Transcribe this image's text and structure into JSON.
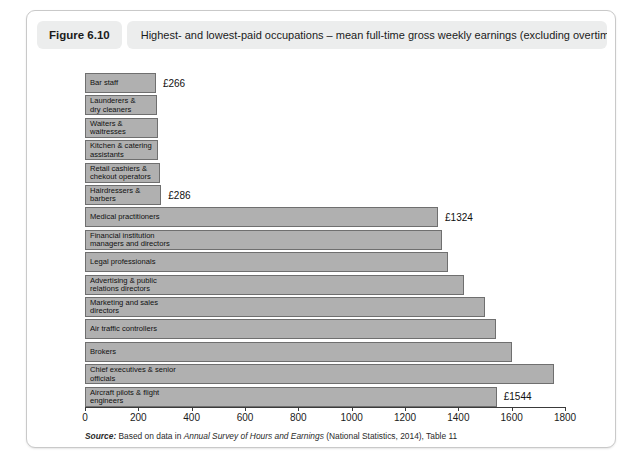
{
  "figure": {
    "number": "Figure 6.10",
    "title": "Highest- and lowest-paid occupations – mean full-time gross weekly earnings (excluding overtime) (£): 2014"
  },
  "source": {
    "prefix": "Source:",
    "lead": "Based on data in",
    "publication": "Annual Survey of Hours and Earnings",
    "suffix": "(National Statistics, 2014), Table 11"
  },
  "chart_data": {
    "type": "bar",
    "orientation": "horizontal",
    "title": "Highest- and lowest-paid occupations – mean full-time gross weekly earnings (excluding overtime) (£): 2014",
    "xlabel": "",
    "ylabel": "",
    "xlim": [
      0,
      1800
    ],
    "xticks": [
      0,
      200,
      400,
      600,
      800,
      1000,
      1200,
      1400,
      1600,
      1800
    ],
    "xticklabels": [
      "0",
      "200",
      "400",
      "600",
      "800",
      "1000",
      "1200",
      "1400",
      "1600",
      "1800"
    ],
    "grid": false,
    "legend": false,
    "bar_color": "#b0b0b0",
    "bar_border_color": "#6f6f6f",
    "categories": [
      "Bar staff",
      "Launderers &\ndry cleaners",
      "Waiters &\nwaitresses",
      "Kitchen & catering\nassistants",
      "Retail cashiers &\nchekout operators",
      "Hairdressers &\nbarbers",
      "Medical practitioners",
      "Financial institution\nmanagers and directors",
      "Legal professionals",
      "Advertising & public\nrelations directors",
      "Marketing and sales\ndirectors",
      "Air traffic controllers",
      "Brokers",
      "Chief executives & senior\nofficials",
      "Aircraft pilots & flight\nengineers"
    ],
    "values": [
      266,
      270,
      272,
      274,
      280,
      286,
      1324,
      1340,
      1360,
      1420,
      1500,
      1540,
      1600,
      1760,
      1544
    ],
    "data_labels": [
      {
        "index": 0,
        "text": "£266"
      },
      {
        "index": 5,
        "text": "£286"
      },
      {
        "index": 6,
        "text": "£1324"
      },
      {
        "index": 14,
        "text": "£1544"
      }
    ]
  }
}
